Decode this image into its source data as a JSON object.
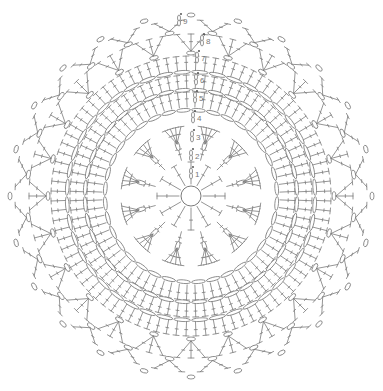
{
  "diagram": {
    "type": "crochet-round-chart",
    "center": {
      "x": 191,
      "y": 196
    },
    "ring_radius": 10,
    "stroke_color": "#7a7a7a",
    "row_numbers": [
      {
        "label": "1",
        "x": 195,
        "y": 177
      },
      {
        "label": "2",
        "x": 195,
        "y": 159
      },
      {
        "label": "3",
        "x": 196,
        "y": 140
      },
      {
        "label": "4",
        "x": 197,
        "y": 121
      },
      {
        "label": "5",
        "x": 199,
        "y": 101
      },
      {
        "label": "6",
        "x": 200,
        "y": 83
      },
      {
        "label": "7",
        "x": 201,
        "y": 61
      },
      {
        "label": "8",
        "x": 206,
        "y": 44
      },
      {
        "label": "9",
        "x": 183,
        "y": 24
      }
    ],
    "rows": [
      {
        "row": 1,
        "kind": "spokes",
        "count": 12,
        "r0": 12,
        "r1": 34,
        "offset": 0
      },
      {
        "row": 2,
        "kind": "spokes-oval",
        "count": 12,
        "r0": 37,
        "r1": 48,
        "oval_r": 52,
        "offset": 15
      },
      {
        "row": 3,
        "kind": "fan",
        "count": 12,
        "per_group": 4,
        "r0": 54,
        "r1": 70,
        "spread": 18,
        "offset": 15
      },
      {
        "row": 4,
        "kind": "chain-ring",
        "count": 36,
        "r": 86
      },
      {
        "row": 5,
        "kind": "dense",
        "count": 72,
        "r0": 89,
        "r1": 104
      },
      {
        "row": 6,
        "kind": "chain-ring",
        "count": 40,
        "r": 106
      },
      {
        "row": 6,
        "kind": "dense",
        "count": 80,
        "r0": 108,
        "r1": 121
      },
      {
        "row": 7,
        "kind": "chain-ring",
        "count": 44,
        "r": 124
      },
      {
        "row": 7,
        "kind": "dense",
        "count": 88,
        "r0": 126,
        "r1": 140
      },
      {
        "row": 8,
        "kind": "fan-oval",
        "count": 24,
        "per_group": 3,
        "oval_r": 143,
        "r1": 162,
        "spread": 10,
        "offset": 0
      },
      {
        "row": 9,
        "kind": "fan-oval",
        "count": 24,
        "per_group": 2,
        "oval_r": 164,
        "r1": 176,
        "spread": 9,
        "offset": 7.5
      },
      {
        "row": 9,
        "kind": "ovals",
        "count": 24,
        "r": 181,
        "offset": 0
      }
    ]
  }
}
